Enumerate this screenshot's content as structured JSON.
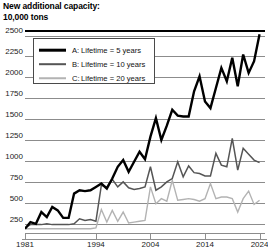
{
  "title": "New additional capacity:\n10,000 tons",
  "legend": {
    "items": [
      {
        "key": "A:",
        "label": "Lifetime = 5 years",
        "color": "#000000",
        "width": 2.6
      },
      {
        "key": "B:",
        "label": "Lifetime = 10 years",
        "color": "#555555",
        "width": 1.6
      },
      {
        "key": "C:",
        "label": "Lifetime = 20 years",
        "color": "#b3b3b3",
        "width": 1.5
      }
    ]
  },
  "chart_data": {
    "type": "line",
    "title": "New additional capacity: 10,000 tons",
    "xlabel": "",
    "ylabel": "10,000 tons",
    "xlim": [
      1981,
      2025
    ],
    "ylim": [
      150,
      2560
    ],
    "yticks": [
      2500,
      2250,
      2000,
      1750,
      1500,
      1250,
      1000,
      750,
      500,
      250
    ],
    "xticks": [
      1981,
      1994,
      2004,
      2014,
      2024
    ],
    "xticklabels": [
      "1981",
      "1994",
      "2004",
      "2014",
      "2024"
    ],
    "grid": true,
    "legend_position": "upper left",
    "series": [
      {
        "name": "A: Lifetime = 5 years",
        "color": "#000000",
        "linewidth": 2.4,
        "x": [
          1981,
          1982,
          1983,
          1984,
          1985,
          1986,
          1987,
          1988,
          1989,
          1990,
          1991,
          1992,
          1993,
          1994,
          1995,
          1996,
          1997,
          1998,
          1999,
          2000,
          2001,
          2002,
          2003,
          2004,
          2005,
          2006,
          2007,
          2008,
          2009,
          2010,
          2011,
          2012,
          2013,
          2014,
          2015,
          2016,
          2017,
          2018,
          2019,
          2020,
          2021,
          2022,
          2023,
          2024
        ],
        "values": [
          200,
          280,
          260,
          400,
          340,
          460,
          420,
          330,
          330,
          620,
          660,
          650,
          660,
          700,
          740,
          680,
          800,
          940,
          1020,
          880,
          1000,
          1120,
          1030,
          1300,
          1520,
          1260,
          1430,
          1620,
          1550,
          1540,
          1540,
          1840,
          2020,
          1720,
          1640,
          1880,
          2120,
          1960,
          2240,
          1900,
          2280,
          2060,
          2200,
          2520
        ]
      },
      {
        "name": "B: Lifetime = 10 years",
        "color": "#555555",
        "linewidth": 1.5,
        "x": [
          1981,
          1982,
          1983,
          1984,
          1985,
          1986,
          1987,
          1988,
          1989,
          1990,
          1991,
          1992,
          1993,
          1994,
          1995,
          1996,
          1997,
          1998,
          1999,
          2000,
          2001,
          2002,
          2003,
          2004,
          2005,
          2006,
          2007,
          2008,
          2009,
          2010,
          2011,
          2012,
          2013,
          2014,
          2015,
          2016,
          2017,
          2018,
          2019,
          2020,
          2021,
          2022,
          2023,
          2024
        ],
        "values": [
          210,
          250,
          250,
          250,
          260,
          250,
          250,
          250,
          250,
          260,
          320,
          300,
          310,
          290,
          720,
          700,
          790,
          700,
          760,
          690,
          670,
          680,
          700,
          940,
          660,
          700,
          760,
          800,
          1000,
          820,
          950,
          870,
          860,
          830,
          830,
          1100,
          960,
          940,
          1280,
          900,
          1160,
          1090,
          1020,
          990
        ]
      },
      {
        "name": "C: Lifetime = 20 years",
        "color": "#b3b3b3",
        "linewidth": 1.4,
        "x": [
          1981,
          1982,
          1983,
          1984,
          1985,
          1986,
          1987,
          1988,
          1989,
          1990,
          1991,
          1992,
          1993,
          1994,
          1995,
          1996,
          1997,
          1998,
          1999,
          2000,
          2001,
          2002,
          2003,
          2004,
          2005,
          2006,
          2007,
          2008,
          2009,
          2010,
          2011,
          2012,
          2013,
          2014,
          2015,
          2016,
          2017,
          2018,
          2019,
          2020,
          2021,
          2022,
          2023,
          2024
        ],
        "values": [
          200,
          200,
          200,
          200,
          200,
          200,
          200,
          200,
          200,
          200,
          200,
          200,
          200,
          210,
          430,
          280,
          420,
          290,
          400,
          270,
          280,
          290,
          300,
          700,
          500,
          560,
          530,
          780,
          540,
          550,
          560,
          550,
          530,
          560,
          740,
          560,
          580,
          580,
          560,
          400,
          560,
          650,
          490,
          540
        ]
      }
    ]
  }
}
